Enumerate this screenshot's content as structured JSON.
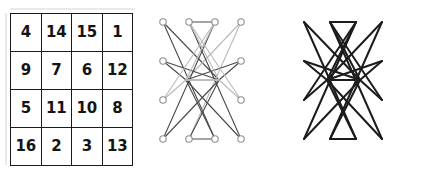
{
  "figure": {
    "panel_count": 3
  },
  "magic_square": {
    "name": "Durer 4x4 magic square",
    "rows": 4,
    "cols": 4,
    "magic_constant": 34,
    "cells": [
      [
        "4",
        "14",
        "15",
        "1"
      ],
      [
        "9",
        "7",
        "6",
        "12"
      ],
      [
        "5",
        "11",
        "10",
        "8"
      ],
      [
        "16",
        "2",
        "3",
        "13"
      ]
    ],
    "border_color": "#1a1a1a",
    "text_color": "#141414"
  },
  "graph_light": {
    "name": "pair graph with visible nodes",
    "node_count": 16,
    "node_radius": 3.2,
    "node_stroke": "#8f8f8f",
    "node_fill": "#ffffff",
    "edge_color_dark": "#4a4a4a",
    "edge_color_light": "#b9b9b9",
    "edge_width": 1.1,
    "columns_x": [
      22,
      48,
      74,
      100
    ],
    "rows_y": [
      22,
      61,
      100,
      139
    ],
    "collapsed_center_left_x": 45,
    "collapsed_center_right_x": 78,
    "collapsed_center_y": 80
  },
  "graph_dark": {
    "name": "pair graph with nodes collapsed",
    "node_count": 0,
    "edge_color": "#1c1c1c",
    "edge_width": 2.0,
    "columns_x": [
      22,
      48,
      74,
      100
    ],
    "rows_y": [
      22,
      61,
      100,
      139
    ],
    "collapsed_center_left_x": 45,
    "collapsed_center_right_x": 78,
    "collapsed_center_y": 80
  },
  "chart_data": {
    "type": "diagram",
    "panels": [
      {
        "id": "magic-square",
        "kind": "table",
        "rows": [
          [
            "4",
            "14",
            "15",
            "1"
          ],
          [
            "9",
            "7",
            "6",
            "12"
          ],
          [
            "5",
            "11",
            "10",
            "8"
          ],
          [
            "16",
            "2",
            "3",
            "13"
          ]
        ],
        "row_sums": [
          34,
          34,
          34,
          34
        ],
        "col_sums": [
          34,
          34,
          34,
          34
        ],
        "diagonal_sums": [
          34,
          34
        ]
      },
      {
        "id": "graph-with-nodes",
        "kind": "node-link",
        "nodes": 16,
        "style": "open circles, thin gray and dark edges"
      },
      {
        "id": "graph-collapsed",
        "kind": "node-link",
        "nodes": 0,
        "style": "thick black edges only, nodes hidden"
      }
    ]
  }
}
